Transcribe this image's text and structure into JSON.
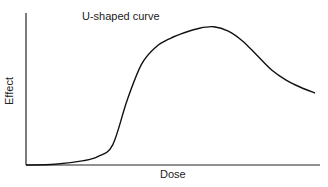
{
  "chart_data": {
    "type": "line",
    "title": "U-shaped curve",
    "xlabel": "Dose",
    "ylabel": "Effect",
    "grid": false,
    "legend": null,
    "x": [
      0,
      10,
      20,
      25,
      30,
      35,
      40,
      45,
      50,
      55,
      60,
      65,
      70,
      75,
      80,
      85,
      90,
      95,
      100
    ],
    "series": [
      {
        "name": "U-shaped curve",
        "values": [
          0,
          0.5,
          3,
          6,
          14,
          45,
          70,
          82,
          88,
          92,
          95,
          96,
          93,
          86,
          76,
          66,
          59,
          54,
          50
        ]
      }
    ],
    "xlim": [
      0,
      100
    ],
    "ylim": [
      0,
      100
    ]
  }
}
